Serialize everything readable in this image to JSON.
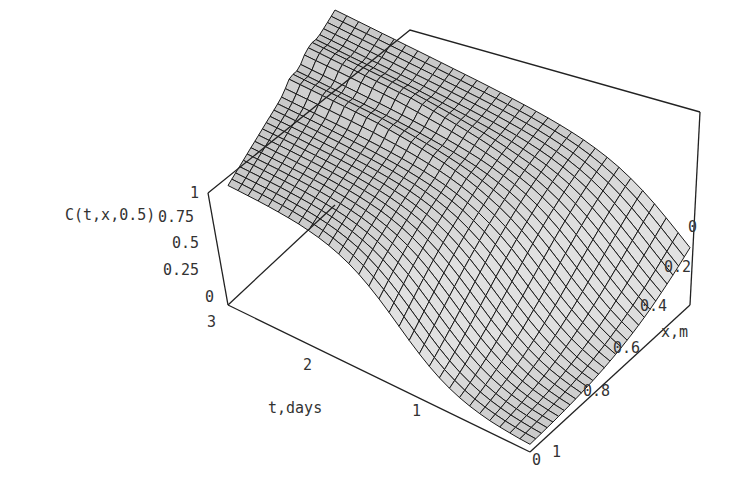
{
  "chart_data": {
    "type": "surface3d",
    "title": "",
    "zlabel": "C(t,x,0.5)",
    "xlabel": "x, m",
    "tlabel": "t, days",
    "z_ticks": [
      "0",
      "0.25",
      "0.5",
      "0.75",
      "1"
    ],
    "x_ticks": [
      "0",
      "0.2",
      "0.4",
      "0.6",
      "0.8",
      "1"
    ],
    "t_ticks": [
      "0",
      "1",
      "2",
      "3"
    ],
    "z_range": [
      0,
      1
    ],
    "x_range": [
      0,
      1
    ],
    "t_range": [
      0,
      3
    ],
    "grid": "mesh",
    "shading": "gray"
  },
  "labels": {
    "zaxis": "C(t,x,0.5)",
    "xaxis": "x,m",
    "taxis": "t,days",
    "z0": "0",
    "z25": "0.25",
    "z50": "0.5",
    "z75": "0.75",
    "z100": "1",
    "x0": "0",
    "x2": "0.2",
    "x4": "0.4",
    "x6": "0.6",
    "x8": "0.8",
    "x10": "1",
    "t0": "0",
    "t1": "1",
    "t2": "2",
    "t3": "3"
  }
}
